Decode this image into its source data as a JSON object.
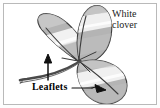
{
  "figure": {
    "frame_color": "#b9b9b9",
    "background_color": "#ffffff"
  },
  "labels": {
    "plant_name_line1": "White",
    "plant_name_line2": "clover",
    "part_label": "Leaflets"
  },
  "illustration": {
    "subject": "white-clover-trifoliate-leaf",
    "leaflet_count": 3,
    "outline_color": "#3a3a3a",
    "fill_gray": "#b0b0b0",
    "fill_light": "#d8d8d8",
    "highlight_band": "#f6f6f6",
    "stem_color": "#4a4a4a",
    "arrow_color": "#1a1a1a",
    "parts": [
      {
        "name": "leaflet-left",
        "position": "upper-left"
      },
      {
        "name": "leaflet-top",
        "position": "top-center"
      },
      {
        "name": "leaflet-lower-right",
        "position": "lower-right"
      },
      {
        "name": "petiole-stem",
        "position": "lower-left"
      }
    ],
    "annotations": [
      {
        "name": "arrow-to-left-leaflet",
        "direction": "up"
      },
      {
        "name": "arrow-to-lower-leaflet",
        "direction": "right-down"
      }
    ]
  }
}
